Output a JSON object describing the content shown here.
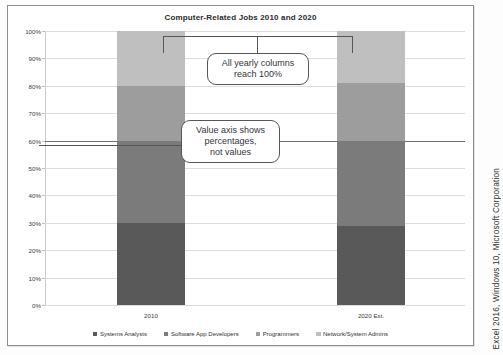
{
  "figure": {
    "credit": "Excel 2016, Windows 10, Microsoft Corporation"
  },
  "chart": {
    "title": "Computer-Related Jobs 2010 and 2020",
    "axis_ticks": [
      "100%",
      "90%",
      "80%",
      "70%",
      "60%",
      "50%",
      "40%",
      "30%",
      "20%",
      "10%",
      "0%"
    ],
    "categories": [
      "2010",
      "2020 Est."
    ],
    "legend": [
      {
        "label": "Systems Analysts",
        "color": "#595959"
      },
      {
        "label": "Software App Developers",
        "color": "#7b7b7b"
      },
      {
        "label": "Programmers",
        "color": "#9d9d9d"
      },
      {
        "label": "Network/System Admins",
        "color": "#bfbfbf"
      }
    ]
  },
  "callouts": [
    {
      "id": "callout-100-percent",
      "text": "All yearly columns\nreach 100%"
    },
    {
      "id": "callout-value-axis",
      "text": "Value axis shows\npercentages,\nnot values"
    }
  ],
  "chart_data": {
    "type": "bar",
    "subtype": "100% stacked column",
    "title": "Computer-Related Jobs 2010 and 2020",
    "xlabel": "",
    "ylabel": "",
    "ylim": [
      0,
      100
    ],
    "ytick_labels": [
      "0%",
      "10%",
      "20%",
      "30%",
      "40%",
      "50%",
      "60%",
      "70%",
      "80%",
      "90%",
      "100%"
    ],
    "ytick_values": [
      0,
      10,
      20,
      30,
      40,
      50,
      60,
      70,
      80,
      90,
      100
    ],
    "grid": true,
    "legend_position": "bottom",
    "categories": [
      "2010",
      "2020 Est."
    ],
    "series": [
      {
        "name": "Systems Analysts",
        "color": "#595959",
        "values": [
          30,
          29
        ]
      },
      {
        "name": "Software App Developers",
        "color": "#7b7b7b",
        "values": [
          30,
          31
        ]
      },
      {
        "name": "Programmers",
        "color": "#9d9d9d",
        "values": [
          20,
          21
        ]
      },
      {
        "name": "Network/System Admins",
        "color": "#bfbfbf",
        "values": [
          20,
          19
        ]
      }
    ],
    "annotations": [
      "All yearly columns reach 100%",
      "Value axis shows percentages, not values"
    ]
  }
}
